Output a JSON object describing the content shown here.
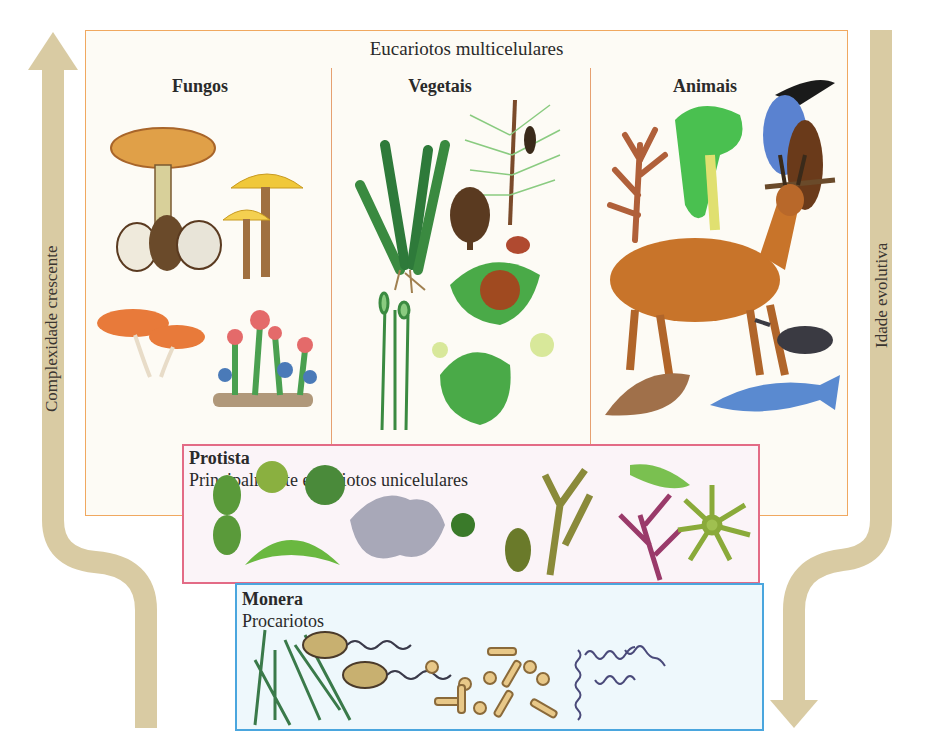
{
  "diagram": {
    "outer_box": {
      "title": "Eucariotos multicelulares",
      "border_color": "#f0a860",
      "kingdoms": [
        {
          "label": "Fungos",
          "organisms": [
            "amanita-mushroom",
            "yellow-mushrooms",
            "orange-mushrooms",
            "lichen"
          ]
        },
        {
          "label": "Vegetais",
          "organisms": [
            "fern",
            "pine-branch",
            "pine-cone",
            "flowering-plant-fruit",
            "moss",
            "liverwort"
          ]
        },
        {
          "label": "Animais",
          "organisms": [
            "coral",
            "chameleon",
            "toucan",
            "deer",
            "beetle",
            "sea-snail",
            "fish"
          ]
        }
      ]
    },
    "protista": {
      "title": "Protista",
      "subtitle": "Principalmente eucariotos unicelulares",
      "border_color": "#e36b86",
      "organisms": [
        "desmid",
        "diatom-round",
        "diatom-split",
        "closterium",
        "amoeba",
        "flagellate",
        "euglenoid",
        "kelp",
        "red-alga",
        "green-cell",
        "heliozoan"
      ]
    },
    "monera": {
      "title": "Monera",
      "subtitle": "Procariotos",
      "border_color": "#4aa6de",
      "organisms": [
        "filamentous-cyanobacteria",
        "flagellated-bacilli",
        "cocci",
        "bacilli",
        "spirochetes"
      ]
    },
    "left_arrow": {
      "label": "Complexidade crescente",
      "direction": "up",
      "color": "#d9cba3"
    },
    "right_arrow": {
      "label": "Idade evolutiva",
      "direction": "down",
      "color": "#d9cba3"
    }
  }
}
